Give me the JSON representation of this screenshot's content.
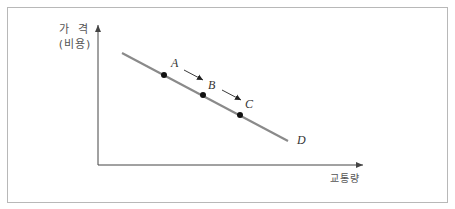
{
  "diagram": {
    "title": "",
    "y_axis_label_line1": "가 격",
    "y_axis_label_line2": "(비용)",
    "x_axis_label": "교통량",
    "curve_label": "D",
    "points": [
      {
        "label": "A",
        "x": 164,
        "y": 75
      },
      {
        "label": "B",
        "x": 203,
        "y": 95
      },
      {
        "label": "C",
        "x": 240,
        "y": 115
      }
    ],
    "curve": {
      "x1": 122,
      "y1": 53,
      "x2": 288,
      "y2": 141
    },
    "arrows": [
      {
        "from": "A",
        "to": "B"
      },
      {
        "from": "B",
        "to": "C"
      }
    ],
    "colors": {
      "curve": "#8a8a8a",
      "axis": "#444444",
      "point": "#111111",
      "frame": "#b8b8b8"
    }
  }
}
